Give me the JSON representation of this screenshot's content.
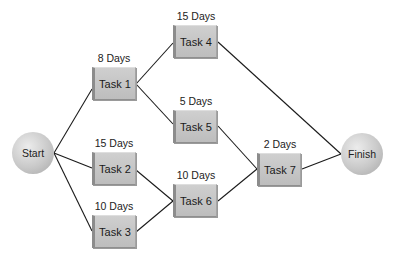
{
  "diagram": {
    "type": "network-diagram",
    "nodes": {
      "start": {
        "label": "Start"
      },
      "finish": {
        "label": "Finish"
      }
    },
    "tasks": [
      {
        "id": "task1",
        "label": "Task 1",
        "duration": "8 Days"
      },
      {
        "id": "task2",
        "label": "Task 2",
        "duration": "15 Days"
      },
      {
        "id": "task3",
        "label": "Task 3",
        "duration": "10 Days"
      },
      {
        "id": "task4",
        "label": "Task 4",
        "duration": "15 Days"
      },
      {
        "id": "task5",
        "label": "Task 5",
        "duration": "5 Days"
      },
      {
        "id": "task6",
        "label": "Task 6",
        "duration": "10 Days"
      },
      {
        "id": "task7",
        "label": "Task 7",
        "duration": "2 Days"
      }
    ],
    "edges": [
      [
        "Start",
        "Task 1"
      ],
      [
        "Start",
        "Task 2"
      ],
      [
        "Start",
        "Task 3"
      ],
      [
        "Task 1",
        "Task 4"
      ],
      [
        "Task 1",
        "Task 5"
      ],
      [
        "Task 2",
        "Task 6"
      ],
      [
        "Task 3",
        "Task 6"
      ],
      [
        "Task 5",
        "Task 7"
      ],
      [
        "Task 6",
        "Task 7"
      ],
      [
        "Task 4",
        "Finish"
      ],
      [
        "Task 7",
        "Finish"
      ]
    ]
  }
}
